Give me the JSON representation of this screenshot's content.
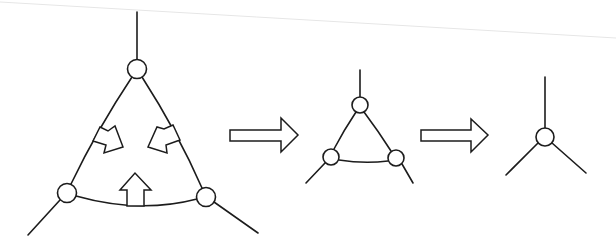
{
  "diagram": {
    "colors": {
      "line": "#1c1c1c",
      "background": "#ffffff"
    },
    "stages": [
      {
        "id": "large-triangle",
        "nodes": [
          {
            "name": "top",
            "cx": 137,
            "cy": 69,
            "r": 9.5
          },
          {
            "name": "bottom-left",
            "cx": 67,
            "cy": 193,
            "r": 9.5
          },
          {
            "name": "bottom-right",
            "cx": 206,
            "cy": 197,
            "r": 9.5
          }
        ],
        "legs": [
          {
            "x1": 137,
            "y1": 12,
            "x2": 137,
            "y2": 59.5
          },
          {
            "x1": 60,
            "y1": 200,
            "x2": 28,
            "y2": 235
          },
          {
            "x1": 214,
            "y1": 202,
            "x2": 258,
            "y2": 233
          }
        ],
        "contraction_arrows": [
          "inward-left",
          "inward-right",
          "upward-bottom"
        ]
      },
      {
        "id": "medium-triangle",
        "nodes": [
          {
            "name": "top",
            "cx": 360,
            "cy": 105,
            "r": 8
          },
          {
            "name": "bottom-left",
            "cx": 331,
            "cy": 157,
            "r": 8
          },
          {
            "name": "bottom-right",
            "cx": 396,
            "cy": 158,
            "r": 8
          }
        ],
        "legs": [
          {
            "x1": 360,
            "y1": 70,
            "x2": 360,
            "y2": 97
          },
          {
            "x1": 325,
            "y1": 163,
            "x2": 306,
            "y2": 183
          },
          {
            "x1": 402,
            "y1": 164,
            "x2": 413,
            "y2": 183
          }
        ]
      },
      {
        "id": "single-vertex",
        "nodes": [
          {
            "name": "center",
            "cx": 545,
            "cy": 137,
            "r": 9
          }
        ],
        "legs": [
          {
            "x1": 545,
            "y1": 77,
            "x2": 545,
            "y2": 128
          },
          {
            "x1": 538,
            "y1": 143,
            "x2": 506,
            "y2": 175
          },
          {
            "x1": 552,
            "y1": 143,
            "x2": 586,
            "y2": 173
          }
        ]
      }
    ],
    "transition_arrows": [
      {
        "name": "arrow-large-to-medium",
        "x": 230,
        "y": 118,
        "w": 68,
        "h": 34
      },
      {
        "name": "arrow-medium-to-single",
        "x": 421,
        "y": 119,
        "w": 67,
        "h": 33
      }
    ]
  }
}
